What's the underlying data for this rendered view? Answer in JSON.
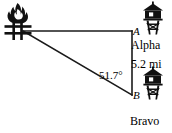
{
  "diagram": {
    "type": "right-triangle-trigonometry",
    "background_color": "#ffffff",
    "stroke_color": "#1a1a1a",
    "vertices": {
      "fire": {
        "x": 23,
        "y": 31,
        "label": "",
        "icon": "campfire-icon"
      },
      "a": {
        "x": 132,
        "y": 31,
        "label": "A",
        "icon": "lookout-tower-icon"
      },
      "b": {
        "x": 132,
        "y": 95,
        "label": "B",
        "icon": "lookout-tower-icon"
      }
    },
    "labels": {
      "vertex_a": "A",
      "vertex_b": "B",
      "station_a_name": "Alpha",
      "station_b_name": "Bravo",
      "side_ab_length": "5.2 mi",
      "angle_at_b": "51.7°"
    },
    "icons": {
      "fire": "campfire-icon",
      "tower_a": "lookout-tower-icon",
      "tower_b": "lookout-tower-icon"
    }
  }
}
